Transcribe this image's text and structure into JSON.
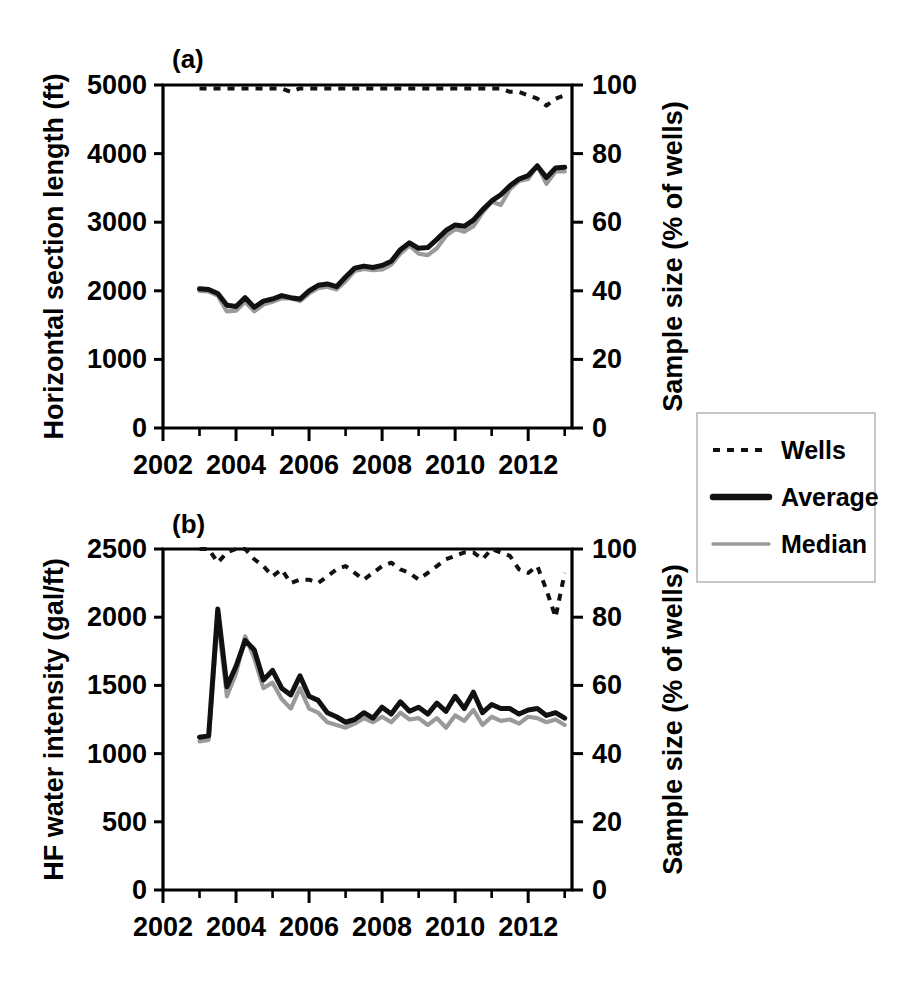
{
  "figure": {
    "width": 918,
    "height": 984,
    "background": "#ffffff"
  },
  "legend": {
    "position": "right-middle",
    "items": [
      {
        "label": "Wells",
        "style": "dotted",
        "color": "#111111"
      },
      {
        "label": "Average",
        "style": "solid-thick",
        "color": "#111111"
      },
      {
        "label": "Median",
        "style": "solid-thin",
        "color": "#9a9a9a"
      }
    ]
  },
  "colors": {
    "average": "#111111",
    "median": "#9a9a9a",
    "wells": "#111111",
    "axis": "#000000",
    "legend_border": "#b9b9b9"
  },
  "chart_data": [
    {
      "id": "panel-a",
      "type": "line",
      "panel_label": "(a)",
      "title": "",
      "xlabel": "",
      "ylabel": "Horizontal section length (ft)",
      "y2label": "Sample size (% of wells)",
      "xlim": [
        2002,
        2013.2
      ],
      "ylim": [
        0,
        5000
      ],
      "y2lim": [
        0,
        100
      ],
      "grid": false,
      "xticks": [
        2002,
        2004,
        2006,
        2008,
        2010,
        2012
      ],
      "xticklabels": [
        "2002",
        "2004",
        "2006",
        "2008",
        "2010",
        "2012"
      ],
      "xminorticks": [
        2003,
        2005,
        2007,
        2009,
        2011,
        2013
      ],
      "yticks": [
        0,
        1000,
        2000,
        3000,
        4000,
        5000
      ],
      "yticklabels": [
        "0",
        "1000",
        "2000",
        "3000",
        "4000",
        "5000"
      ],
      "y2ticks": [
        0,
        20,
        40,
        60,
        80,
        100
      ],
      "y2ticklabels": [
        "0",
        "20",
        "40",
        "60",
        "80",
        "100"
      ],
      "x": [
        2003.0,
        2003.25,
        2003.5,
        2003.75,
        2004.0,
        2004.25,
        2004.5,
        2004.75,
        2005.0,
        2005.25,
        2005.5,
        2005.75,
        2006.0,
        2006.25,
        2006.5,
        2006.75,
        2007.0,
        2007.25,
        2007.5,
        2007.75,
        2008.0,
        2008.25,
        2008.5,
        2008.75,
        2009.0,
        2009.25,
        2009.5,
        2009.75,
        2010.0,
        2010.25,
        2010.5,
        2010.75,
        2011.0,
        2011.25,
        2011.5,
        2011.75,
        2012.0,
        2012.25,
        2012.5,
        2012.75,
        2013.0
      ],
      "series": [
        {
          "name": "Average",
          "axis": "left",
          "values": [
            2030,
            2020,
            1960,
            1790,
            1770,
            1900,
            1760,
            1850,
            1880,
            1930,
            1900,
            1880,
            2000,
            2080,
            2100,
            2060,
            2200,
            2330,
            2360,
            2340,
            2370,
            2430,
            2600,
            2700,
            2620,
            2630,
            2750,
            2880,
            2960,
            2940,
            3030,
            3180,
            3310,
            3400,
            3530,
            3630,
            3680,
            3820,
            3650,
            3790,
            3800
          ]
        },
        {
          "name": "Median",
          "axis": "left",
          "values": [
            2000,
            1990,
            1930,
            1700,
            1710,
            1840,
            1700,
            1800,
            1840,
            1890,
            1890,
            1850,
            1960,
            2040,
            2060,
            2020,
            2140,
            2290,
            2320,
            2300,
            2310,
            2380,
            2540,
            2660,
            2540,
            2520,
            2620,
            2800,
            2900,
            2860,
            2940,
            3140,
            3300,
            3250,
            3480,
            3600,
            3630,
            3830,
            3560,
            3740,
            3740
          ]
        },
        {
          "name": "Wells",
          "axis": "right",
          "values": [
            99,
            99,
            99,
            99,
            99,
            99,
            99,
            99,
            99,
            99,
            98,
            99,
            99,
            99,
            99,
            99,
            99,
            99,
            99,
            99,
            99,
            99,
            99,
            99,
            99,
            99,
            99,
            99,
            99,
            99,
            99,
            99,
            99,
            99,
            98,
            98,
            97,
            96,
            94,
            96,
            97
          ]
        }
      ]
    },
    {
      "id": "panel-b",
      "type": "line",
      "panel_label": "(b)",
      "title": "",
      "xlabel": "",
      "ylabel": "HF water intensity (gal/ft)",
      "y2label": "Sample size (% of wells)",
      "xlim": [
        2002,
        2013.2
      ],
      "ylim": [
        0,
        2500
      ],
      "y2lim": [
        0,
        100
      ],
      "grid": false,
      "xticks": [
        2002,
        2004,
        2006,
        2008,
        2010,
        2012
      ],
      "xticklabels": [
        "2002",
        "2004",
        "2006",
        "2008",
        "2010",
        "2012"
      ],
      "xminorticks": [
        2003,
        2005,
        2007,
        2009,
        2011,
        2013
      ],
      "yticks": [
        0,
        500,
        1000,
        1500,
        2000,
        2500
      ],
      "yticklabels": [
        "0",
        "500",
        "1000",
        "1500",
        "2000",
        "2500"
      ],
      "y2ticks": [
        0,
        20,
        40,
        60,
        80,
        100
      ],
      "y2ticklabels": [
        "0",
        "20",
        "40",
        "60",
        "80",
        "100"
      ],
      "x": [
        2003.0,
        2003.25,
        2003.5,
        2003.75,
        2004.0,
        2004.25,
        2004.5,
        2004.75,
        2005.0,
        2005.25,
        2005.5,
        2005.75,
        2006.0,
        2006.25,
        2006.5,
        2006.75,
        2007.0,
        2007.25,
        2007.5,
        2007.75,
        2008.0,
        2008.25,
        2008.5,
        2008.75,
        2009.0,
        2009.25,
        2009.5,
        2009.75,
        2010.0,
        2010.25,
        2010.5,
        2010.75,
        2011.0,
        2011.25,
        2011.5,
        2011.75,
        2012.0,
        2012.25,
        2012.5,
        2012.75,
        2013.0
      ],
      "series": [
        {
          "name": "Average",
          "axis": "left",
          "values": [
            1120,
            1130,
            2060,
            1490,
            1640,
            1830,
            1760,
            1540,
            1610,
            1480,
            1430,
            1570,
            1420,
            1390,
            1300,
            1270,
            1230,
            1250,
            1300,
            1260,
            1340,
            1290,
            1380,
            1310,
            1340,
            1290,
            1370,
            1310,
            1420,
            1330,
            1450,
            1300,
            1360,
            1330,
            1330,
            1290,
            1320,
            1330,
            1280,
            1300,
            1260
          ]
        },
        {
          "name": "Median",
          "axis": "left",
          "values": [
            1090,
            1100,
            2000,
            1420,
            1590,
            1860,
            1700,
            1480,
            1520,
            1400,
            1330,
            1480,
            1330,
            1300,
            1230,
            1210,
            1190,
            1220,
            1260,
            1230,
            1270,
            1230,
            1300,
            1250,
            1260,
            1210,
            1260,
            1190,
            1280,
            1240,
            1320,
            1210,
            1270,
            1240,
            1250,
            1220,
            1270,
            1260,
            1230,
            1250,
            1210
          ]
        },
        {
          "name": "Wells",
          "axis": "right",
          "values": [
            100,
            100,
            96,
            99,
            100,
            100,
            97,
            95,
            92,
            94,
            90,
            91,
            91,
            90,
            92,
            94,
            95,
            93,
            91,
            93,
            95,
            96,
            94,
            93,
            91,
            93,
            95,
            97,
            98,
            99,
            99,
            97,
            100,
            99,
            98,
            94,
            93,
            95,
            88,
            80,
            93
          ]
        }
      ]
    }
  ]
}
